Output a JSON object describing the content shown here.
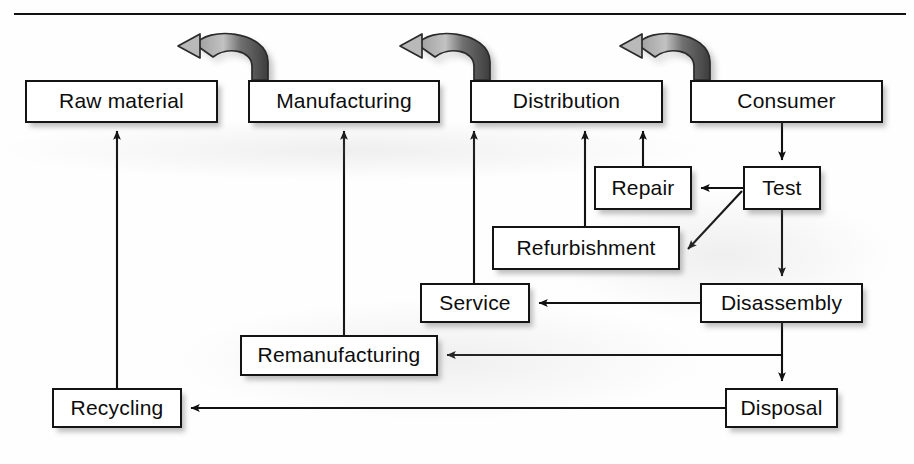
{
  "figure": {
    "kind": "flow-diagram",
    "title_rule": "horizontal-rule",
    "background_color": "#ffffff",
    "line_color": "#111111",
    "box_fill": "#ffffff",
    "curved_arrow_fill_light": "#b5b5b5",
    "curved_arrow_fill_dark": "#4a4a4a"
  },
  "nodes": [
    {
      "id": "raw-material",
      "label": "Raw material",
      "x": 25,
      "y": 80,
      "w": 193,
      "h": 43
    },
    {
      "id": "manufacturing",
      "label": "Manufacturing",
      "x": 248,
      "y": 80,
      "w": 192,
      "h": 43
    },
    {
      "id": "distribution",
      "label": "Distribution",
      "x": 470,
      "y": 80,
      "w": 193,
      "h": 43
    },
    {
      "id": "consumer",
      "label": "Consumer",
      "x": 690,
      "y": 80,
      "w": 193,
      "h": 43
    },
    {
      "id": "repair",
      "label": "Repair",
      "x": 594,
      "y": 166,
      "w": 98,
      "h": 44
    },
    {
      "id": "test",
      "label": "Test",
      "x": 743,
      "y": 166,
      "w": 78,
      "h": 44
    },
    {
      "id": "refurbishment",
      "label": "Refurbishment",
      "x": 492,
      "y": 226,
      "w": 188,
      "h": 44
    },
    {
      "id": "service",
      "label": "Service",
      "x": 420,
      "y": 283,
      "w": 110,
      "h": 40
    },
    {
      "id": "disassembly",
      "label": "Disassembly",
      "x": 700,
      "y": 283,
      "w": 163,
      "h": 40
    },
    {
      "id": "remanufacturing",
      "label": "Remanufacturing",
      "x": 240,
      "y": 335,
      "w": 198,
      "h": 41
    },
    {
      "id": "recycling",
      "label": "Recycling",
      "x": 52,
      "y": 388,
      "w": 130,
      "h": 40
    },
    {
      "id": "disposal",
      "label": "Disposal",
      "x": 725,
      "y": 388,
      "w": 113,
      "h": 40
    }
  ],
  "edges": [
    {
      "id": "consumer-to-test",
      "from": "consumer",
      "to": "test",
      "style": "straight-down"
    },
    {
      "id": "test-to-repair",
      "from": "test",
      "to": "repair",
      "style": "straight-left"
    },
    {
      "id": "test-to-refurbishment",
      "from": "test",
      "to": "refurbishment",
      "style": "diagonal"
    },
    {
      "id": "test-to-disassembly",
      "from": "test",
      "to": "disassembly",
      "style": "straight-down"
    },
    {
      "id": "disassembly-to-service",
      "from": "disassembly",
      "to": "service",
      "style": "straight-left"
    },
    {
      "id": "disassembly-to-remanufacturing",
      "from": "disassembly",
      "to": "remanufacturing",
      "style": "straight-left"
    },
    {
      "id": "disassembly-to-disposal",
      "from": "disassembly",
      "to": "disposal",
      "style": "straight-down"
    },
    {
      "id": "disposal-to-recycling",
      "from": "disposal",
      "to": "recycling",
      "style": "straight-left"
    },
    {
      "id": "recycling-to-raw-material",
      "from": "recycling",
      "to": "raw-material",
      "style": "straight-up"
    },
    {
      "id": "remanufacturing-to-manufacturing",
      "from": "remanufacturing",
      "to": "manufacturing",
      "style": "straight-up"
    },
    {
      "id": "service-to-distribution",
      "from": "service",
      "to": "distribution",
      "style": "straight-up"
    },
    {
      "id": "refurbishment-to-distribution",
      "from": "refurbishment",
      "to": "distribution",
      "style": "straight-up"
    },
    {
      "id": "repair-to-distribution",
      "from": "repair",
      "to": "distribution",
      "style": "straight-up"
    }
  ],
  "curved_arrows": [
    {
      "id": "manufacturing-to-raw-material",
      "from": "manufacturing",
      "to": "raw-material",
      "direction": "right-to-left"
    },
    {
      "id": "distribution-to-manufacturing",
      "from": "distribution",
      "to": "manufacturing",
      "direction": "right-to-left"
    },
    {
      "id": "consumer-to-distribution",
      "from": "consumer",
      "to": "distribution",
      "direction": "right-to-left"
    }
  ]
}
